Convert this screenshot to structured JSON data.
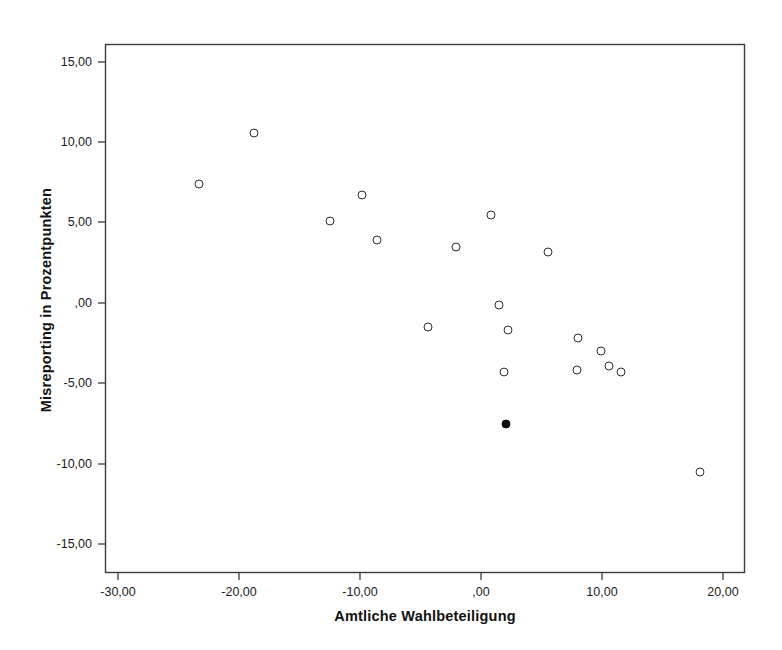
{
  "chart_data": {
    "type": "scatter",
    "title": "",
    "xlabel": "Amtliche Wahlbeteiligung",
    "ylabel": "Misreporting in Prozentpunkten",
    "xlim": [
      -33.5,
      23.5
    ],
    "ylim": [
      -16.5,
      16.5
    ],
    "grid": false,
    "legend": null,
    "xticks": [
      -30,
      -20,
      -10,
      0,
      10,
      20
    ],
    "xtick_labels": [
      "-30,00",
      "-20,00",
      "-10,00",
      ",00",
      "10,00",
      "20,00"
    ],
    "yticks": [
      15,
      10,
      5,
      0,
      -5,
      -10,
      -15
    ],
    "ytick_labels": [
      "15,00",
      "10,00",
      "5,00",
      ",00",
      "-5,00",
      "-10,00",
      "-15,00"
    ],
    "series": [
      {
        "name": "Fälle",
        "marker": "open-circle",
        "color": "#2c2c34",
        "points": [
          {
            "x": -23.3,
            "y": 7.4
          },
          {
            "x": -18.8,
            "y": 10.6
          },
          {
            "x": -12.5,
            "y": 5.1
          },
          {
            "x": -9.8,
            "y": 6.7
          },
          {
            "x": -8.6,
            "y": 3.9
          },
          {
            "x": -4.4,
            "y": -1.5
          },
          {
            "x": -2.1,
            "y": 3.5
          },
          {
            "x": 0.8,
            "y": 5.5
          },
          {
            "x": 1.5,
            "y": -0.1
          },
          {
            "x": 2.2,
            "y": -1.7
          },
          {
            "x": 1.9,
            "y": -4.3
          },
          {
            "x": 5.5,
            "y": 3.2
          },
          {
            "x": 8.0,
            "y": -2.2
          },
          {
            "x": 7.9,
            "y": -4.2
          },
          {
            "x": 9.9,
            "y": -3.0
          },
          {
            "x": 10.6,
            "y": -3.9
          },
          {
            "x": 11.6,
            "y": -4.3
          },
          {
            "x": 18.1,
            "y": -10.5
          }
        ]
      },
      {
        "name": "Hervorgehobener Fall",
        "marker": "filled-circle",
        "color": "#0d0d10",
        "points": [
          {
            "x": 2.1,
            "y": -7.5
          }
        ]
      }
    ]
  },
  "axis": {
    "x_title": "Amtliche Wahlbeteiligung",
    "y_title": "Misreporting in Prozentpunkten"
  }
}
